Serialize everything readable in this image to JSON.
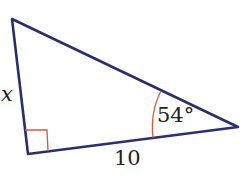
{
  "figure": {
    "type": "right-triangle",
    "labels": {
      "side_left": "x",
      "angle": "54°",
      "side_bottom": "10"
    },
    "colors": {
      "triangle_stroke": "#2b2e6e",
      "marker_stroke": "#e0553a"
    },
    "vertices": {
      "top_left": [
        12,
        19
      ],
      "bottom_left_right_angle": [
        28,
        154
      ],
      "right": [
        238,
        127
      ]
    }
  }
}
